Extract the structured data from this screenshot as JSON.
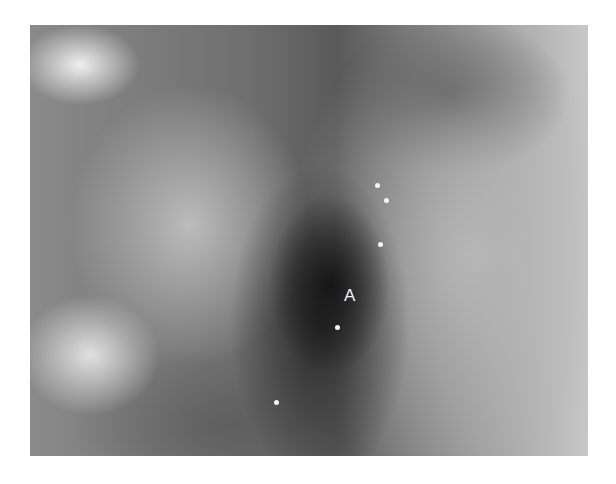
{
  "image": {
    "description": "Grayscale endoscopic photograph of a tubular lumen with dark region",
    "annotation_label": "A"
  },
  "specks": [
    {
      "x": 375,
      "y": 183
    },
    {
      "x": 384,
      "y": 198
    },
    {
      "x": 378,
      "y": 242
    },
    {
      "x": 335,
      "y": 325
    },
    {
      "x": 274,
      "y": 400
    }
  ]
}
